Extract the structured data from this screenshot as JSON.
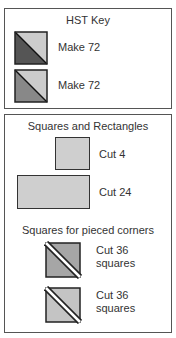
{
  "hst_key": {
    "title": "HST Key",
    "items": [
      {
        "label": "Make 72",
        "icon": "hst-dark-light-icon",
        "dark": "#555555",
        "light": "#cccccc"
      },
      {
        "label": "Make 72",
        "icon": "hst-medium-light-icon",
        "dark": "#888888",
        "light": "#cccccc"
      }
    ]
  },
  "squares_rectangles": {
    "title": "Squares and Rectangles",
    "items": [
      {
        "label": "Cut 4",
        "shape": "square",
        "fill": "#cfcfcf"
      },
      {
        "label": "Cut 24",
        "shape": "rectangle",
        "fill": "#cfcfcf"
      }
    ],
    "pieced_corners_title": "Squares for pieced corners",
    "corners": [
      {
        "label_line1": "Cut 36",
        "label_line2": "squares",
        "fill": "#a6a6a6"
      },
      {
        "label_line1": "Cut 36",
        "label_line2": "squares",
        "fill": "#c4c4c4"
      }
    ]
  }
}
